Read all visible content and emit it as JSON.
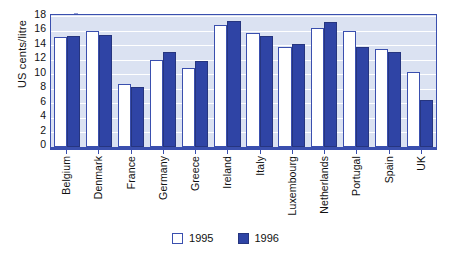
{
  "chart_data": {
    "type": "bar",
    "title": "",
    "xlabel": "",
    "ylabel": "US cents/litre",
    "ylim": [
      0,
      18
    ],
    "yticks": [
      0,
      2,
      4,
      6,
      8,
      10,
      12,
      14,
      16,
      18
    ],
    "grid": true,
    "legend_position": "bottom-center",
    "categories": [
      "Belgium",
      "Denmark",
      "France",
      "Germany",
      "Greece",
      "Ireland",
      "Italy",
      "Luxembourg",
      "Netherlands",
      "Portugal",
      "Spain",
      "UK"
    ],
    "series": [
      {
        "name": "1995",
        "color": "#ffffff",
        "values": [
          15.1,
          16.0,
          8.6,
          11.9,
          10.8,
          16.8,
          15.7,
          13.7,
          16.3,
          16.0,
          13.4,
          10.3
        ]
      },
      {
        "name": "1996",
        "color": "#2f44a5",
        "values": [
          15.3,
          15.4,
          8.3,
          13.0,
          11.8,
          17.3,
          15.3,
          14.2,
          17.2,
          13.8,
          13.1,
          6.4
        ]
      }
    ]
  },
  "legend": {
    "items": [
      {
        "label": "1995"
      },
      {
        "label": "1996"
      }
    ]
  },
  "colors": {
    "bar_1995_fill": "#ffffff",
    "bar_1996_fill": "#2f44a5",
    "bar_stroke": "#3a4fae",
    "plot_background": "#dbe2f2",
    "gridline": "#ffffff",
    "axis": "#3a4fae",
    "text": "#111111"
  }
}
